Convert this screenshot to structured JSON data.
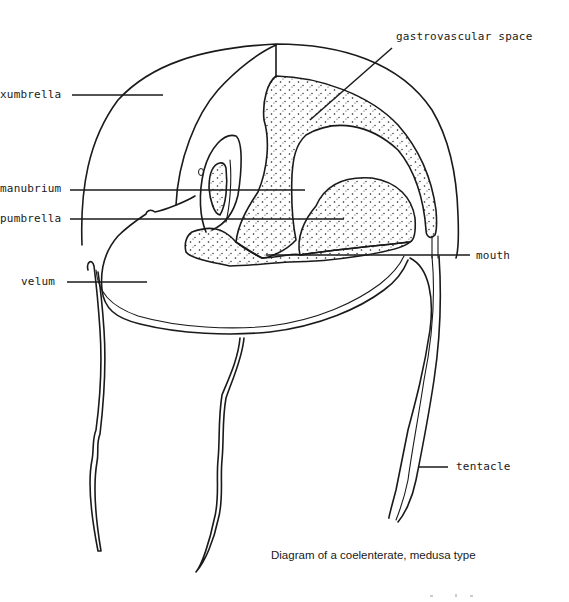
{
  "diagram": {
    "title": "Diagram of a coelenterate, medusa type",
    "labels": {
      "exumbrella": "xumbrella",
      "manubrium": "manubrium",
      "subumbrella": "pumbrella",
      "velum": "velum",
      "gastrovascular_space": "gastrovascular space",
      "mouth": "mouth",
      "tentacle": "tentacle"
    },
    "colors": {
      "ink": "#1a1a1a",
      "background": "#ffffff"
    }
  }
}
